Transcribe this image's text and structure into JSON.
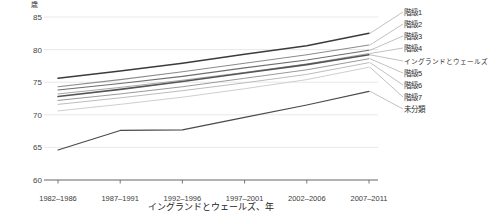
{
  "chart_data": {
    "type": "line",
    "title": "",
    "subtitle": "",
    "xlabel": "イングランドとウェールズ、年",
    "ylabel": "歳",
    "unit_label": "歳",
    "categories": [
      "1982–1986",
      "1987–1991",
      "1992–1996",
      "1997–2001",
      "2002–2006",
      "2007–2011"
    ],
    "ylim": [
      60,
      85
    ],
    "yticks": [
      60,
      65,
      70,
      75,
      80,
      85
    ],
    "grid": true,
    "legend_position": "right-outside",
    "series": [
      {
        "name": "階級1",
        "values": [
          75.6,
          76.7,
          77.9,
          79.3,
          80.6,
          82.5
        ],
        "color": "#3b3b3b",
        "width": 1.5
      },
      {
        "name": "階級2",
        "values": [
          74.3,
          75.4,
          76.6,
          77.9,
          79.2,
          80.7
        ],
        "color": "#8c8c8c",
        "width": 1.1
      },
      {
        "name": "階級3",
        "values": [
          73.8,
          74.8,
          75.9,
          77.2,
          78.4,
          79.9
        ],
        "color": "#6e6e6e",
        "width": 1.1
      },
      {
        "name": "階級4",
        "values": [
          73.2,
          74.2,
          75.3,
          76.5,
          77.8,
          79.4
        ],
        "color": "#a8a8a8",
        "width": 1.0
      },
      {
        "name": "イングランドとウェールズ",
        "values": [
          72.8,
          73.9,
          75.1,
          76.4,
          77.7,
          79.2
        ],
        "color": "#555555",
        "width": 1.6
      },
      {
        "name": "階級5",
        "values": [
          72.2,
          73.2,
          74.3,
          75.6,
          76.9,
          78.6
        ],
        "color": "#9a9a9a",
        "width": 1.0
      },
      {
        "name": "階級6",
        "values": [
          71.6,
          72.6,
          73.7,
          74.9,
          76.2,
          78.0
        ],
        "color": "#bdbdbd",
        "width": 1.0
      },
      {
        "name": "階級7",
        "values": [
          70.6,
          71.6,
          72.7,
          74.0,
          75.4,
          77.3
        ],
        "color": "#cfcfcf",
        "width": 1.0
      },
      {
        "name": "未分類",
        "values": [
          64.6,
          67.6,
          67.7,
          69.6,
          71.5,
          73.6
        ],
        "color": "#4a4a4a",
        "width": 1.2
      }
    ]
  }
}
